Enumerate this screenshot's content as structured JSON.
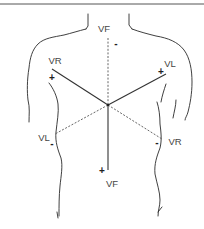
{
  "diagram": {
    "title": "",
    "colors": {
      "ink": "#333333",
      "background": "#ffffff"
    },
    "leads": [
      {
        "name": "VF",
        "positive_label": "VF",
        "negative_label": "VF",
        "positive_sign": "+",
        "negative_sign": "-",
        "positive_end": "bottom",
        "negative_end": "top"
      },
      {
        "name": "VR",
        "positive_label": "VR",
        "negative_label": "VR",
        "positive_sign": "+",
        "negative_sign": "-",
        "positive_end": "upper-left",
        "negative_end": "lower-right"
      },
      {
        "name": "VL",
        "positive_label": "VL",
        "negative_label": "VL",
        "positive_sign": "+",
        "negative_sign": "-",
        "positive_end": "upper-right",
        "negative_end": "lower-left"
      }
    ],
    "labels": {
      "vf_top": "VF",
      "vf_bottom": "VF",
      "vr_upper": "VR",
      "vr_lower": "VR",
      "vl_upper": "VL",
      "vl_lower": "VL"
    },
    "signs": {
      "vf_top": "-",
      "vf_bottom": "+",
      "vr_upper": "+",
      "vr_lower": "-",
      "vl_upper": "+",
      "vl_lower": "-"
    }
  }
}
